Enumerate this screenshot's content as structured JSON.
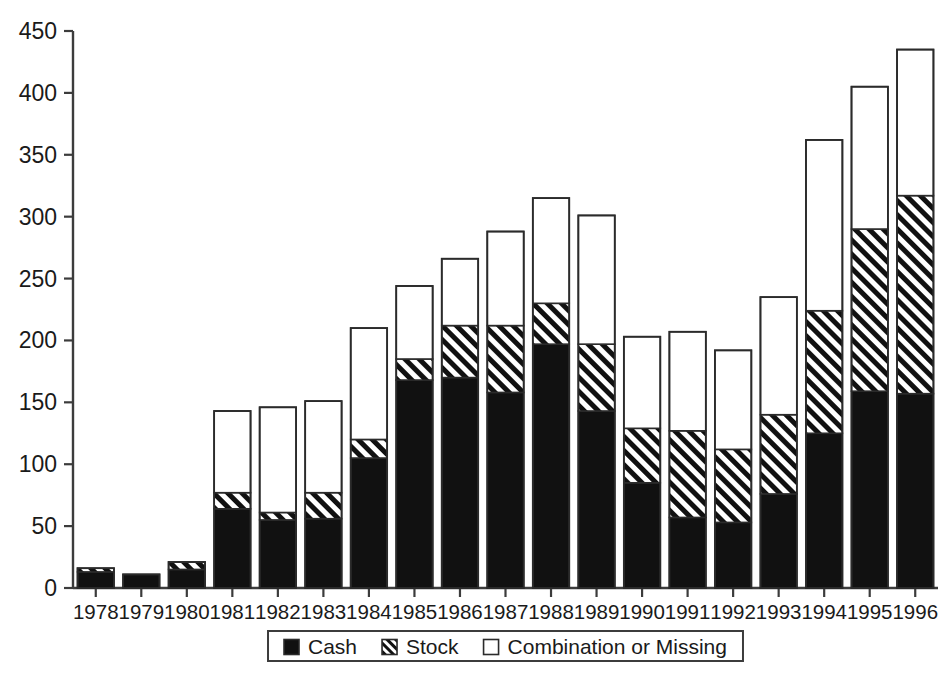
{
  "chart_data": {
    "type": "bar",
    "subtype": "stacked-bar",
    "title": "",
    "xlabel": "",
    "ylabel": "",
    "ylim": [
      0,
      450
    ],
    "yticks": [
      0,
      50,
      100,
      150,
      200,
      250,
      300,
      350,
      400,
      450
    ],
    "ytick_labels": [
      "0",
      "50",
      "100",
      "150",
      "200",
      "250",
      "300",
      "350",
      "400",
      "450"
    ],
    "grid": false,
    "legend_position": "bottom-center",
    "categories": [
      "1978",
      "1979",
      "1980",
      "1981",
      "1982",
      "1983",
      "1984",
      "1985",
      "1986",
      "1987",
      "1988",
      "1989",
      "1990",
      "1991",
      "1992",
      "1993",
      "1994",
      "1995",
      "1996"
    ],
    "series": [
      {
        "name": "Cash",
        "fill": "solid-black",
        "color": "#000000",
        "values": [
          13,
          11,
          15,
          64,
          55,
          56,
          105,
          168,
          170,
          158,
          197,
          143,
          85,
          57,
          53,
          76,
          125,
          159,
          157
        ]
      },
      {
        "name": "Stock",
        "fill": "diagonal-hatch",
        "color": "#ffffff",
        "values": [
          3,
          0,
          6,
          13,
          6,
          21,
          15,
          17,
          42,
          54,
          33,
          54,
          44,
          70,
          59,
          64,
          99,
          131,
          160
        ]
      },
      {
        "name": "Combination or Missing",
        "fill": "white",
        "color": "#ffffff",
        "values": [
          0,
          0,
          0,
          66,
          85,
          74,
          90,
          59,
          54,
          76,
          85,
          104,
          74,
          80,
          80,
          95,
          138,
          115,
          118
        ]
      }
    ],
    "totals": [
      16,
      11,
      21,
      143,
      146,
      151,
      210,
      244,
      266,
      288,
      315,
      301,
      203,
      207,
      192,
      235,
      362,
      405,
      435
    ]
  },
  "legend": {
    "items": [
      {
        "label": "Cash",
        "swatch": "solid-black-square"
      },
      {
        "label": "Stock",
        "swatch": "hatched-square"
      },
      {
        "label": "Combination or Missing",
        "swatch": "white-square"
      }
    ]
  },
  "axes": {
    "y_axis_name": "value-axis",
    "x_axis_name": "year-axis"
  }
}
